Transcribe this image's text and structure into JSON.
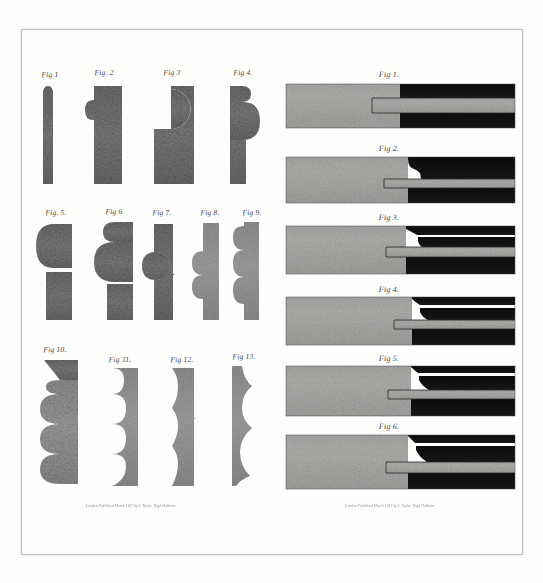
{
  "plate": {
    "background_color": "#fdfdfc",
    "border_color": "#b9b9b9",
    "ink_light": "#9a9a9a",
    "ink_mid": "#7e7e7e",
    "ink_dark": "#111111",
    "label_color": "#3a3a3a"
  },
  "left_panel": {
    "imprint": "London Published March 1817 by I. Taylor, High Holborn.",
    "rows": [
      {
        "figures": [
          {
            "label": "Fig 1",
            "name": "fig-1-moulding-profile",
            "profile": "bead-half-round-narrow"
          },
          {
            "label": "Fig. 2",
            "name": "fig-2-moulding-profile",
            "profile": "single-bead-top"
          },
          {
            "label": "Fig 3",
            "name": "fig-3-moulding-profile",
            "profile": "large-round-and-bead"
          },
          {
            "label": "Fig 4.",
            "name": "fig-4-moulding-profile",
            "profile": "bead-over-large-round"
          }
        ]
      },
      {
        "figures": [
          {
            "label": "Fig. 5.",
            "name": "fig-5-moulding-profile",
            "profile": "large-ovolo-and-fillet"
          },
          {
            "label": "Fig 6",
            "name": "fig-6-moulding-profile",
            "profile": "bead-over-torus"
          },
          {
            "label": "Fig 7.",
            "name": "fig-7-moulding-profile",
            "profile": "two-beads-stacked"
          },
          {
            "label": "Fig 8.",
            "name": "fig-8-moulding-profile",
            "profile": "three-reeds"
          },
          {
            "label": "Fig 9.",
            "name": "fig-9-moulding-profile",
            "profile": "three-reeds-tall"
          }
        ]
      },
      {
        "figures": [
          {
            "label": "Fig 10.",
            "name": "fig-10-moulding-profile",
            "profile": "five-scallops-with-fillet"
          },
          {
            "label": "Fig 11.",
            "name": "fig-11-moulding-profile",
            "profile": "four-flutes"
          },
          {
            "label": "Fig 12.",
            "name": "fig-12-moulding-profile",
            "profile": "shallow-wave"
          },
          {
            "label": "Fig 13.",
            "name": "fig-13-moulding-profile",
            "profile": "ogee-wave-edge"
          }
        ]
      }
    ]
  },
  "right_panel": {
    "imprint": "London Published March 1817 by I. Taylor, High Holborn.",
    "figures": [
      {
        "label": "Fig 1.",
        "name": "fig-1-section-plane",
        "profile": "straight-tongue-rebate"
      },
      {
        "label": "Fig 2.",
        "name": "fig-2-section-plane",
        "profile": "bead-stop-tongue"
      },
      {
        "label": "Fig 3.",
        "name": "fig-3-section-plane",
        "profile": "bead-stepped-tongue"
      },
      {
        "label": "Fig 4.",
        "name": "fig-4-section-plane",
        "profile": "ogee-stop-tongue"
      },
      {
        "label": "Fig 5.",
        "name": "fig-5-section-plane",
        "profile": "double-bead-tongue"
      },
      {
        "label": "Fig 6.",
        "name": "fig-6-section-plane",
        "profile": "deep-bead-tongue"
      }
    ]
  }
}
